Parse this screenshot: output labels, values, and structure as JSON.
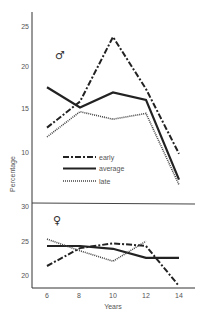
{
  "chart_data": [
    {
      "type": "line",
      "panel": "male",
      "symbol": "♂",
      "x": [
        6,
        8,
        10,
        12,
        14
      ],
      "series": [
        {
          "name": "early",
          "style": "dash-dot",
          "values": [
            12.9,
            16.0,
            23.7,
            17.5,
            9.8
          ]
        },
        {
          "name": "average",
          "style": "solid",
          "values": [
            17.7,
            15.3,
            17.1,
            16.2,
            6.7
          ]
        },
        {
          "name": "late",
          "style": "dotted",
          "values": [
            11.8,
            14.8,
            13.9,
            14.6,
            6.1
          ]
        }
      ],
      "yticks": [
        10,
        15,
        20,
        25
      ],
      "ylim": [
        5,
        26.5
      ],
      "grid": false
    },
    {
      "type": "line",
      "panel": "female",
      "symbol": "♀",
      "x": [
        6,
        8,
        10,
        12,
        14
      ],
      "series": [
        {
          "name": "early",
          "style": "dash-dot",
          "values": [
            21.3,
            23.9,
            24.6,
            24.2,
            18.4
          ]
        },
        {
          "name": "average",
          "style": "solid",
          "values": [
            24.2,
            24.2,
            23.8,
            22.5,
            22.5
          ]
        },
        {
          "name": "late",
          "style": "dotted",
          "values": [
            25.2,
            23.5,
            22.0,
            24.9,
            null
          ]
        }
      ],
      "yticks": [
        20,
        25,
        30
      ],
      "ylim": [
        18,
        30
      ],
      "grid": false
    }
  ],
  "labels": {
    "xlabel": "Years",
    "ylabel": "Percentage",
    "xticks": [
      "6",
      "8",
      "10",
      "12",
      "14"
    ],
    "yticks_top": [
      "25",
      "20",
      "15",
      "10"
    ],
    "yticks_bottom": [
      "30",
      "25",
      "20"
    ],
    "male_symbol": "♂",
    "female_symbol": "♀"
  },
  "legend": {
    "position": "inside-top-panel-lower-left",
    "items": [
      {
        "label": "early",
        "style": "dash-dot"
      },
      {
        "label": "average",
        "style": "solid"
      },
      {
        "label": "late",
        "style": "dotted"
      }
    ]
  }
}
